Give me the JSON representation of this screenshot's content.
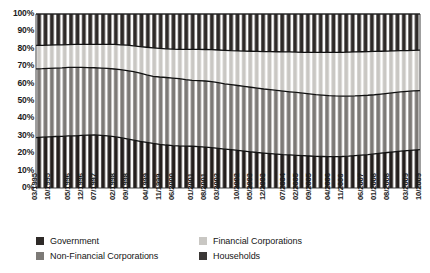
{
  "chart_data": {
    "type": "area",
    "title": "",
    "subtitle": "",
    "xlabel": "",
    "ylabel": "",
    "ylim": [
      0,
      100
    ],
    "y_unit": "%",
    "grid": false,
    "stacked": true,
    "stack_total": 100,
    "legend_position": "bottom",
    "yticks": [
      "0%",
      "10%",
      "20%",
      "30%",
      "40%",
      "50%",
      "60%",
      "70%",
      "80%",
      "90%",
      "100%"
    ],
    "ytick_values": [
      0,
      10,
      20,
      30,
      40,
      50,
      60,
      70,
      80,
      90,
      100
    ],
    "categories": [
      "03/1995",
      "06/1995",
      "09/1995",
      "12/1995",
      "03/1996",
      "06/1996",
      "09/1996",
      "12/1996",
      "03/1997",
      "06/1997",
      "09/1997",
      "12/1997",
      "03/1998",
      "06/1998",
      "09/1998",
      "12/1998",
      "03/1999",
      "06/1999",
      "09/1999",
      "12/1999",
      "03/2000",
      "06/2000",
      "09/2000",
      "12/2000",
      "03/2001",
      "06/2001",
      "09/2001",
      "12/2001",
      "03/2002",
      "06/2002",
      "09/2002",
      "12/2002",
      "03/2003",
      "06/2003",
      "09/2003",
      "12/2003",
      "03/2004",
      "06/2004",
      "09/2004",
      "12/2004",
      "03/2005",
      "06/2005",
      "09/2005",
      "12/2005",
      "03/2006",
      "06/2006",
      "09/2006",
      "12/2006",
      "03/2007",
      "06/2007",
      "09/2007",
      "12/2007",
      "03/2008",
      "06/2008",
      "09/2008",
      "12/2008",
      "03/2009",
      "06/2009",
      "09/2009",
      "12/2009"
    ],
    "xtick_labels": [
      "03/1995",
      "10/1995",
      "05/1996",
      "12/1996",
      "07/1997",
      "02/1998",
      "09/1998",
      "04/1999",
      "11/1999",
      "06/2000",
      "01/2001",
      "08/2001",
      "03/2002",
      "10/2002",
      "05/2003",
      "12/2003",
      "07/2004",
      "02/2005",
      "09/2005",
      "04/2006",
      "11/2006",
      "06/2007",
      "01/2008",
      "08/2008",
      "03/2009",
      "10/2009"
    ],
    "xtick_indices": [
      0,
      3,
      6,
      9,
      12,
      15,
      18,
      21,
      24,
      27,
      30,
      33,
      36,
      39,
      42,
      45,
      48,
      51,
      54,
      57
    ],
    "series": [
      {
        "name": "Households",
        "color": "#241f1d",
        "stack_order": 1,
        "values": [
          29.0,
          29.2,
          29.4,
          29.6,
          29.7,
          29.9,
          30.0,
          30.2,
          30.4,
          30.5,
          30.3,
          30.0,
          29.5,
          28.9,
          28.2,
          27.5,
          26.8,
          26.2,
          25.6,
          25.1,
          24.7,
          24.4,
          24.2,
          24.1,
          24.0,
          23.8,
          23.5,
          23.2,
          22.8,
          22.4,
          22.0,
          21.6,
          21.2,
          20.8,
          20.4,
          20.1,
          19.8,
          19.5,
          19.2,
          19.0,
          18.8,
          18.6,
          18.4,
          18.2,
          18.1,
          18.0,
          18.0,
          18.1,
          18.3,
          18.6,
          18.9,
          19.2,
          19.6,
          20.0,
          20.4,
          20.8,
          21.2,
          21.5,
          21.8,
          22.0
        ]
      },
      {
        "name": "Non-Financial Corporations",
        "color": "#7d7a77",
        "stack_order": 2,
        "values": [
          39.5,
          39.4,
          39.4,
          39.3,
          39.3,
          39.4,
          39.3,
          39.1,
          38.8,
          38.6,
          38.6,
          38.7,
          38.9,
          39.1,
          39.3,
          39.4,
          39.2,
          38.8,
          38.6,
          38.7,
          38.8,
          38.8,
          38.6,
          38.2,
          37.9,
          37.9,
          38.0,
          37.9,
          37.7,
          37.5,
          37.4,
          37.3,
          37.2,
          37.1,
          37.0,
          36.8,
          36.7,
          36.6,
          36.5,
          36.3,
          36.1,
          35.9,
          35.7,
          35.5,
          35.3,
          35.1,
          34.9,
          34.7,
          34.5,
          34.3,
          34.2,
          34.1,
          34.0,
          34.0,
          34.0,
          34.0,
          34.0,
          34.0,
          34.0,
          34.0
        ]
      },
      {
        "name": "Financial Corporations",
        "color": "#c9c7c3",
        "stack_order": 3,
        "values": [
          13.5,
          13.4,
          13.3,
          13.3,
          13.2,
          13.1,
          13.2,
          13.3,
          13.3,
          13.4,
          13.6,
          13.8,
          14.1,
          14.3,
          14.6,
          14.8,
          15.3,
          15.9,
          16.3,
          16.4,
          16.5,
          16.6,
          16.9,
          17.4,
          17.8,
          18.0,
          18.1,
          18.4,
          18.8,
          19.2,
          19.5,
          19.9,
          20.3,
          20.7,
          21.1,
          21.5,
          21.9,
          22.2,
          22.5,
          22.9,
          23.2,
          23.5,
          23.9,
          24.2,
          24.5,
          24.8,
          25.0,
          25.2,
          25.3,
          25.3,
          25.2,
          25.1,
          24.9,
          24.6,
          24.3,
          24.0,
          23.7,
          23.5,
          23.3,
          23.2
        ]
      },
      {
        "name": "Government",
        "color": "#2e2a28",
        "stack_order": 4,
        "values": [
          18.0,
          18.0,
          17.9,
          17.8,
          17.8,
          17.6,
          17.5,
          17.4,
          17.5,
          17.5,
          17.5,
          17.5,
          17.5,
          17.7,
          17.9,
          18.3,
          18.7,
          19.1,
          19.5,
          19.8,
          20.0,
          20.2,
          20.3,
          20.3,
          20.3,
          20.3,
          20.4,
          20.5,
          20.7,
          20.9,
          21.1,
          21.2,
          21.3,
          21.4,
          21.5,
          21.6,
          21.6,
          21.7,
          21.8,
          21.8,
          21.9,
          22.0,
          22.0,
          22.1,
          22.1,
          22.1,
          22.1,
          22.0,
          21.9,
          21.8,
          21.7,
          21.6,
          21.5,
          21.4,
          21.3,
          21.2,
          21.1,
          21.0,
          20.9,
          20.8
        ]
      }
    ],
    "boundaries_note": "Stacked 100% area chart with vertical bar hatching; boundary lines drawn in black.",
    "legend": [
      {
        "label": "Government",
        "color": "#2e2a28"
      },
      {
        "label": "Financial Corporations",
        "color": "#c9c7c3"
      },
      {
        "label": "Non-Financial Corporations",
        "color": "#7d7a77"
      },
      {
        "label": "Households",
        "color": "#3b3836"
      }
    ]
  }
}
